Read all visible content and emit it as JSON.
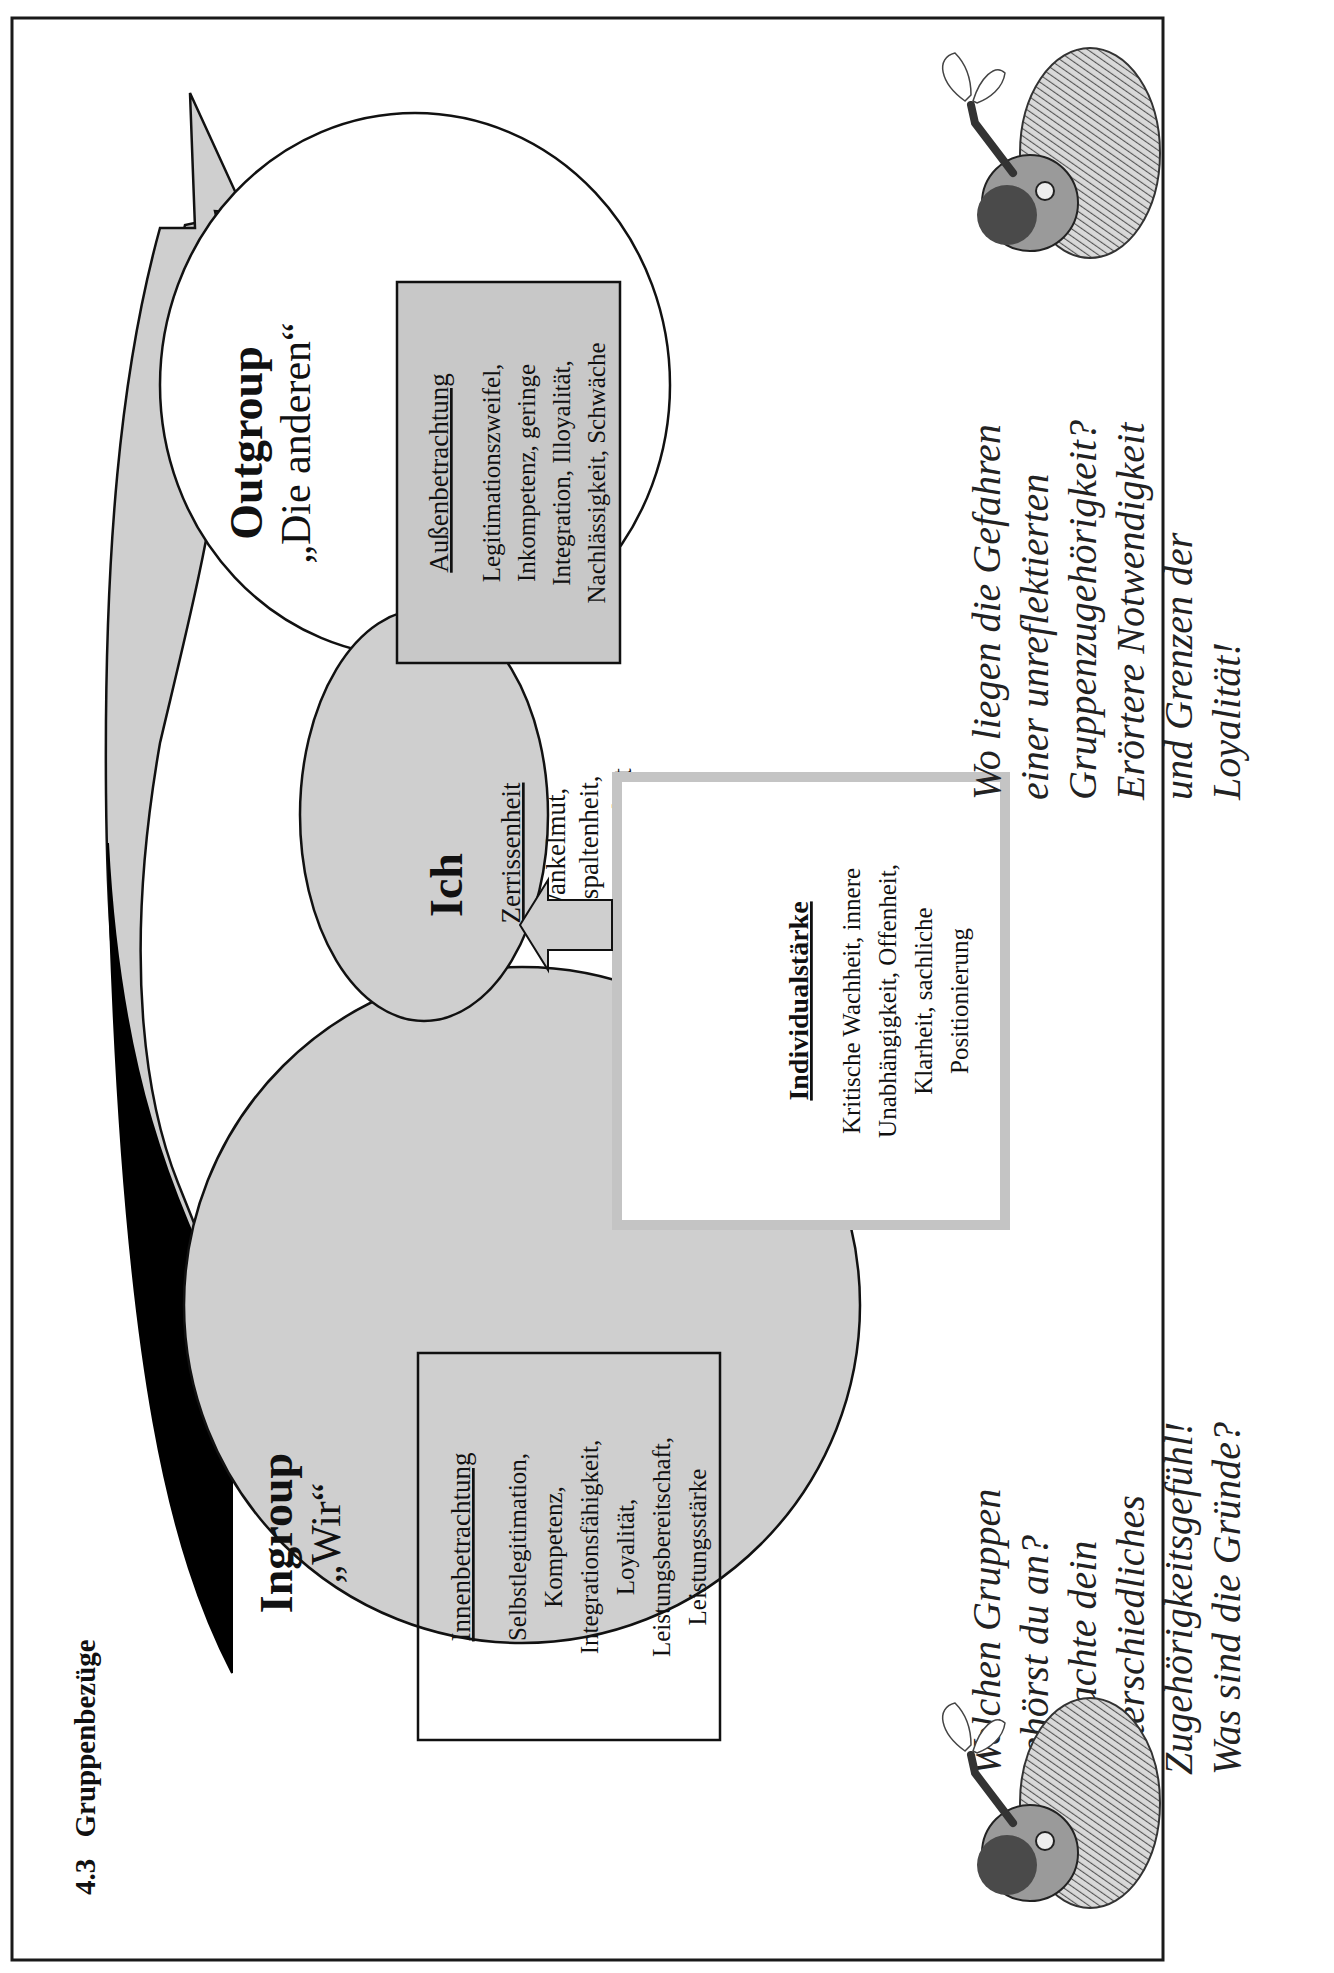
{
  "page": {
    "section_number": "4.3",
    "section_title": "Gruppenbezüge"
  },
  "colors": {
    "frame": "#1a1a1a",
    "circle_fill": "#cfcfcf",
    "outgroup_fill": "#ffffff",
    "outgroup_box_fill": "#c8c8c8",
    "arrow_fill": "#cfcfcf",
    "black_wedge": "#000000",
    "individual_border": "#c4c4c4"
  },
  "ingroup": {
    "title": "Ingroup",
    "subtitle": "„Wir“",
    "box": {
      "heading": "Innenbetrachtung",
      "lines": [
        "Selbstlegitimation,",
        "Kompetenz,",
        "Integrationsfähigkeit,",
        "Loyalität,",
        "Leistungsbereitschaft,",
        "Leistungsstärke"
      ]
    }
  },
  "ich": {
    "title": "Ich",
    "heading": "Zerrissenheit",
    "lines": [
      "Wankelmut,",
      "Gespaltenheit,",
      "Zweizüngigkeit"
    ]
  },
  "outgroup": {
    "title": "Outgroup",
    "subtitle": "„Die anderen“",
    "box": {
      "heading": "Außenbetrachtung",
      "lines": [
        "Legitimationszweifel,",
        "Inkompetenz, geringe",
        "Integration, Illoyalität,",
        "Nachlässigkeit, Schwäche"
      ]
    }
  },
  "individual": {
    "heading": "Individualstärke",
    "lines": [
      "Kritische Wachheit, innere",
      "Unabhängigkeit, Offenheit,",
      "Klarheit, sachliche",
      "Positionierung"
    ]
  },
  "questions": {
    "left": [
      "Welchen Gruppen",
      "gehörst du an?",
      "Betrachte dein",
      "unterschiedliches",
      "Zugehörigkeitsgefühl!",
      "Was sind die Gründe?"
    ],
    "right": [
      "Wo liegen die Gefahren",
      "einer unreflektierten",
      "Gruppenzugehörigkeit?",
      "Erörtere Notwendigkeit",
      "und Grenzen der",
      "Loyalität!"
    ]
  },
  "illustrations": {
    "left": "man-with-butterfly-icon",
    "right": "man-with-butterfly-icon"
  }
}
